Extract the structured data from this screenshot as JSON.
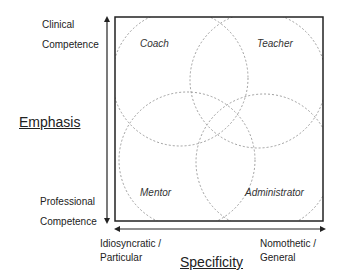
{
  "diagram": {
    "y_axis": {
      "title": "Emphasis",
      "top_label_line1": "Clinical",
      "top_label_line2": "Competence",
      "bottom_label_line1": "Professional",
      "bottom_label_line2": "Competence"
    },
    "x_axis": {
      "title": "Specificity",
      "left_label_line1": "Idiosyncratic /",
      "left_label_line2": "Particular",
      "right_label_line1": "Nomothetic /",
      "right_label_line2": "General"
    },
    "roles": [
      {
        "name": "Coach",
        "quadrant": "top-left"
      },
      {
        "name": "Teacher",
        "quadrant": "top-right"
      },
      {
        "name": "Mentor",
        "quadrant": "bottom-left"
      },
      {
        "name": "Administrator",
        "quadrant": "bottom-right"
      }
    ],
    "colors": {
      "frame": "#222222",
      "circle": "#888888"
    }
  }
}
